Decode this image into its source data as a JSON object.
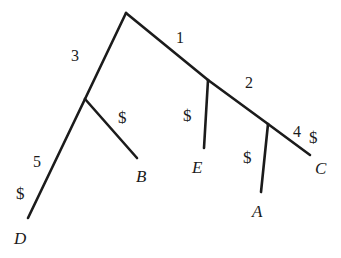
{
  "figure": {
    "width": 341,
    "height": 258,
    "background_color": "#ffffff",
    "line_color": "#1b1b1b",
    "text_color": "#1b1b1b",
    "line_width": 2.6
  },
  "nodes": {
    "root": {
      "name": "root",
      "x": 126,
      "y": 13
    },
    "node_left": {
      "name": "node-left",
      "x": 85,
      "y": 99
    },
    "node_right": {
      "name": "node-right",
      "x": 208,
      "y": 80
    },
    "node_right_inner": {
      "name": "node-right-inner",
      "x": 268,
      "y": 124
    },
    "tip_D": {
      "name": "tip-D",
      "x": 28,
      "y": 218
    },
    "tip_B": {
      "name": "tip-B",
      "x": 137,
      "y": 158
    },
    "tip_E": {
      "name": "tip-E",
      "x": 204,
      "y": 148
    },
    "tip_A": {
      "name": "tip-A",
      "x": 261,
      "y": 192
    },
    "tip_C": {
      "name": "tip-C",
      "x": 310,
      "y": 155
    }
  },
  "edges": [
    {
      "name": "edge-root-to-left",
      "from": "root",
      "to": "node_left",
      "x1": 126,
      "y1": 13,
      "x2": 85,
      "y2": 99
    },
    {
      "name": "edge-root-to-right",
      "from": "root",
      "to": "node_right",
      "x1": 126,
      "y1": 13,
      "x2": 208,
      "y2": 80
    },
    {
      "name": "edge-left-to-D",
      "from": "node_left",
      "to": "tip_D",
      "x1": 85,
      "y1": 99,
      "x2": 28,
      "y2": 218
    },
    {
      "name": "edge-left-to-B",
      "from": "node_left",
      "to": "tip_B",
      "x1": 85,
      "y1": 99,
      "x2": 137,
      "y2": 158
    },
    {
      "name": "edge-right-to-E",
      "from": "node_right",
      "to": "tip_E",
      "x1": 208,
      "y1": 80,
      "x2": 204,
      "y2": 148
    },
    {
      "name": "edge-right-to-inner",
      "from": "node_right",
      "to": "node_right_inner",
      "x1": 208,
      "y1": 80,
      "x2": 268,
      "y2": 124
    },
    {
      "name": "edge-inner-to-A",
      "from": "node_right_inner",
      "to": "tip_A",
      "x1": 268,
      "y1": 124,
      "x2": 261,
      "y2": 192
    },
    {
      "name": "edge-inner-to-C",
      "from": "node_right_inner",
      "to": "tip_C",
      "x1": 268,
      "y1": 124,
      "x2": 310,
      "y2": 155
    }
  ],
  "branch_numbers": [
    {
      "name": "branch-number-3",
      "text": "3",
      "x": 71,
      "y": 48,
      "edge": "edge-root-to-left"
    },
    {
      "name": "branch-number-1",
      "text": "1",
      "x": 176,
      "y": 30,
      "edge": "edge-root-to-right"
    },
    {
      "name": "branch-number-2",
      "text": "2",
      "x": 245,
      "y": 75,
      "edge": "edge-right-to-inner"
    },
    {
      "name": "branch-number-5",
      "text": "5",
      "x": 33,
      "y": 154,
      "edge": "edge-left-to-D"
    },
    {
      "name": "branch-number-4",
      "text": "4",
      "x": 293,
      "y": 124,
      "edge": "edge-inner-to-C"
    }
  ],
  "mutation_markers": [
    {
      "name": "mutation-marker-D",
      "text": "$",
      "x": 16,
      "y": 185,
      "edge": "edge-left-to-D"
    },
    {
      "name": "mutation-marker-B",
      "text": "$",
      "x": 118,
      "y": 109,
      "edge": "edge-left-to-B"
    },
    {
      "name": "mutation-marker-E",
      "text": "$",
      "x": 183,
      "y": 107,
      "edge": "edge-right-to-E"
    },
    {
      "name": "mutation-marker-A",
      "text": "$",
      "x": 243,
      "y": 149,
      "edge": "edge-inner-to-A"
    },
    {
      "name": "mutation-marker-C",
      "text": "$",
      "x": 309,
      "y": 129,
      "edge": "edge-inner-to-C"
    }
  ],
  "taxon_labels": [
    {
      "name": "taxon-label-D",
      "text": "D",
      "x": 14,
      "y": 230
    },
    {
      "name": "taxon-label-B",
      "text": "B",
      "x": 136,
      "y": 168
    },
    {
      "name": "taxon-label-E",
      "text": "E",
      "x": 192,
      "y": 159
    },
    {
      "name": "taxon-label-A",
      "text": "A",
      "x": 252,
      "y": 203
    },
    {
      "name": "taxon-label-C",
      "text": "C",
      "x": 315,
      "y": 160
    }
  ]
}
